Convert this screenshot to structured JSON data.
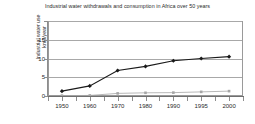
{
  "chart_data": {
    "type": "line",
    "title": "Industrial water withdrawals and consumption in Africa over 50 years",
    "xlabel": "",
    "ylabel": "Industrial water use km3/year",
    "ylabel_lines": [
      "Industrial water use",
      "km3/year"
    ],
    "categories": [
      "1950",
      "1960",
      "1970",
      "1980",
      "1990",
      "1995",
      "2000"
    ],
    "ytick_labels": [
      "0",
      "5",
      "10",
      "15"
    ],
    "ytick_values": [
      0,
      5,
      10,
      15
    ],
    "gridline_values": [
      0,
      5,
      10,
      15,
      20
    ],
    "ylim": [
      0,
      20
    ],
    "grid": true,
    "legend": "none",
    "series": [
      {
        "name": "Industrial water withdrawals",
        "color": "#1a1a1a",
        "marker": "diamond",
        "values": [
          1.3,
          2.7,
          6.8,
          7.9,
          9.4,
          10.0,
          10.5
        ]
      },
      {
        "name": "Industrial water consumption",
        "color": "#a6a6a6",
        "marker": "square",
        "values": [
          0.1,
          0.15,
          0.7,
          0.85,
          0.9,
          1.1,
          1.3
        ]
      }
    ]
  },
  "colors": {
    "background": "#ffffff",
    "gridline": "#a8a8a8",
    "plot_border": "#9a9a9a",
    "text": "#2b2b2b",
    "series1": "#1a1a1a",
    "series2": "#a6a6a6"
  }
}
